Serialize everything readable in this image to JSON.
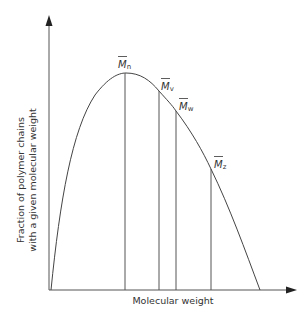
{
  "diagram": {
    "type": "molecular-weight-distribution",
    "x_axis": {
      "label": "Molecular weight"
    },
    "y_axis": {
      "label_line1": "Fraction of polymer chains",
      "label_line2": "with a given molecular weight"
    },
    "averages": [
      {
        "symbol": "M",
        "subscript": "n",
        "name": "number-average"
      },
      {
        "symbol": "M",
        "subscript": "v",
        "name": "viscosity-average"
      },
      {
        "symbol": "M",
        "subscript": "w",
        "name": "weight-average"
      },
      {
        "symbol": "M",
        "subscript": "z",
        "name": "z-average"
      }
    ],
    "colors": {
      "line": "#444444",
      "text": "#333333",
      "background": "#ffffff"
    }
  }
}
